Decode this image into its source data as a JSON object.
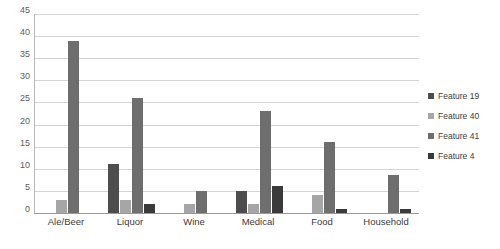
{
  "chart_data": {
    "type": "bar",
    "title": "",
    "subtitle": "",
    "xlabel": "",
    "ylabel": "",
    "ylim": [
      0,
      45
    ],
    "ytick_step": 5,
    "yticks": [
      45,
      40,
      35,
      30,
      25,
      20,
      15,
      10,
      5,
      0
    ],
    "grid": true,
    "legend_position": "right",
    "categories": [
      "Ale/Beer",
      "Liquor",
      "Wine",
      "Medical",
      "Food",
      "Household"
    ],
    "series": [
      {
        "name": "Feature 19",
        "color": "#4d4d4d",
        "values": [
          0,
          11,
          0,
          5,
          0,
          0
        ]
      },
      {
        "name": "Feature 40",
        "color": "#a6a6a6",
        "values": [
          3,
          3,
          2,
          2,
          4,
          0
        ]
      },
      {
        "name": "Feature 41",
        "color": "#6e6e6e",
        "values": [
          39,
          26,
          5,
          23,
          16,
          8.5
        ]
      },
      {
        "name": "Feature 4",
        "color": "#3a3a3a",
        "values": [
          0,
          2,
          0,
          6,
          1,
          1
        ]
      }
    ]
  },
  "legend": {
    "entries": [
      {
        "label": "Feature 19",
        "color": "#4d4d4d"
      },
      {
        "label": "Feature 40",
        "color": "#a6a6a6"
      },
      {
        "label": "Feature 41",
        "color": "#6e6e6e"
      },
      {
        "label": "Feature 4",
        "color": "#3a3a3a"
      }
    ]
  },
  "axes": {
    "y_tick_labels": [
      "45",
      "40",
      "35",
      "30",
      "25",
      "20",
      "15",
      "10",
      "5",
      "0"
    ],
    "x_tick_labels": [
      "Ale/Beer",
      "Liquor",
      "Wine",
      "Medical",
      "Food",
      "Household"
    ]
  }
}
